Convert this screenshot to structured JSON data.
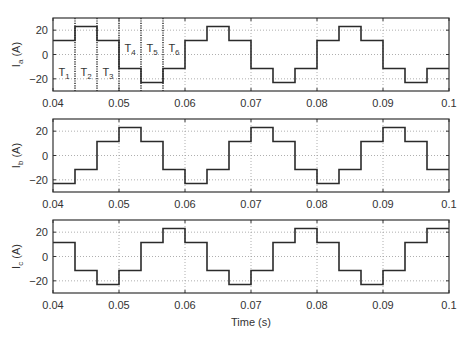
{
  "chart_data": [
    {
      "type": "line",
      "title": "",
      "xlabel": "",
      "ylabel": "I_a (A)",
      "ylabel_main": "I",
      "ylabel_sub": "a",
      "ylabel_unit": " (A)",
      "xlim": [
        0.04,
        0.1
      ],
      "ylim": [
        -30,
        30
      ],
      "xticks": [
        0.04,
        0.05,
        0.06,
        0.07,
        0.08,
        0.09,
        0.1
      ],
      "xtick_labels": [
        "0.04",
        "0.05",
        "0.06",
        "0.07",
        "0.08",
        "0.09",
        "0.1"
      ],
      "yticks": [
        20,
        0,
        -20
      ],
      "ytick_labels": [
        "20",
        "0",
        "−20"
      ],
      "grid": true,
      "step_width": 0.0033333,
      "series": [
        {
          "name": "I_a",
          "start": 0.04,
          "values": [
            11.5,
            23,
            11.5,
            -11.5,
            -23,
            -11.5,
            11.5,
            23,
            11.5,
            -11.5,
            -23,
            -11.5,
            11.5,
            23,
            11.5,
            -11.5,
            -23,
            -11.5
          ]
        }
      ],
      "annotations": {
        "segment_lines": [
          0.043333,
          0.046667,
          0.05,
          0.053333,
          0.056667
        ],
        "segment_labels": [
          {
            "main": "T",
            "sub": "1",
            "x": 0.04167,
            "y": -14
          },
          {
            "main": "T",
            "sub": "2",
            "x": 0.045,
            "y": -14
          },
          {
            "main": "T",
            "sub": "3",
            "x": 0.04833,
            "y": -14
          },
          {
            "main": "T",
            "sub": "4",
            "x": 0.05167,
            "y": 5
          },
          {
            "main": "T",
            "sub": "5",
            "x": 0.055,
            "y": 5
          },
          {
            "main": "T",
            "sub": "6",
            "x": 0.05833,
            "y": 5
          }
        ]
      }
    },
    {
      "type": "line",
      "title": "",
      "xlabel": "",
      "ylabel": "I_b (A)",
      "ylabel_main": "I",
      "ylabel_sub": "b",
      "ylabel_unit": " (A)",
      "xlim": [
        0.04,
        0.1
      ],
      "ylim": [
        -30,
        30
      ],
      "xticks": [
        0.04,
        0.05,
        0.06,
        0.07,
        0.08,
        0.09,
        0.1
      ],
      "xtick_labels": [
        "0.04",
        "0.05",
        "0.06",
        "0.07",
        "0.08",
        "0.09",
        "0.1"
      ],
      "yticks": [
        20,
        0,
        -20
      ],
      "ytick_labels": [
        "20",
        "0",
        "−20"
      ],
      "grid": true,
      "step_width": 0.0033333,
      "series": [
        {
          "name": "I_b",
          "start": 0.04,
          "values": [
            -23,
            -11.5,
            11.5,
            23,
            11.5,
            -11.5,
            -23,
            -11.5,
            11.5,
            23,
            11.5,
            -11.5,
            -23,
            -11.5,
            11.5,
            23,
            11.5,
            -11.5
          ]
        }
      ]
    },
    {
      "type": "line",
      "title": "",
      "xlabel": "Time (s)",
      "ylabel": "I_c (A)",
      "ylabel_main": "I",
      "ylabel_sub": "c",
      "ylabel_unit": " (A)",
      "xlim": [
        0.04,
        0.1
      ],
      "ylim": [
        -30,
        30
      ],
      "xticks": [
        0.04,
        0.05,
        0.06,
        0.07,
        0.08,
        0.09,
        0.1
      ],
      "xtick_labels": [
        "0.04",
        "0.05",
        "0.06",
        "0.07",
        "0.08",
        "0.09",
        "0.1"
      ],
      "yticks": [
        20,
        0,
        -20
      ],
      "ytick_labels": [
        "20",
        "0",
        "−20"
      ],
      "grid": true,
      "step_width": 0.0033333,
      "series": [
        {
          "name": "I_c",
          "start": 0.04,
          "values": [
            11.5,
            -11.5,
            -23,
            -11.5,
            11.5,
            23,
            11.5,
            -11.5,
            -23,
            -11.5,
            11.5,
            23,
            11.5,
            -11.5,
            -23,
            -11.5,
            11.5,
            23
          ]
        }
      ]
    }
  ],
  "colors": {
    "line": "#2b2b2b",
    "axis": "#333333",
    "grid": "#9a9a9a",
    "segment_line": "#222222"
  }
}
